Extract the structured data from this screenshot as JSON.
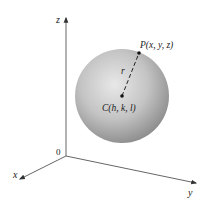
{
  "figure": {
    "axes": {
      "x_label": "x",
      "y_label": "y",
      "z_label": "z",
      "origin_label": "0"
    },
    "points": {
      "P_label": "P(x, y, z)",
      "C_label": "C(h, k, l)"
    },
    "radius_label": "r",
    "colors": {
      "axis": "#555555",
      "sphere_light": "#e6e6e6",
      "sphere_dark": "#8a8a8a",
      "text": "#222222"
    }
  }
}
